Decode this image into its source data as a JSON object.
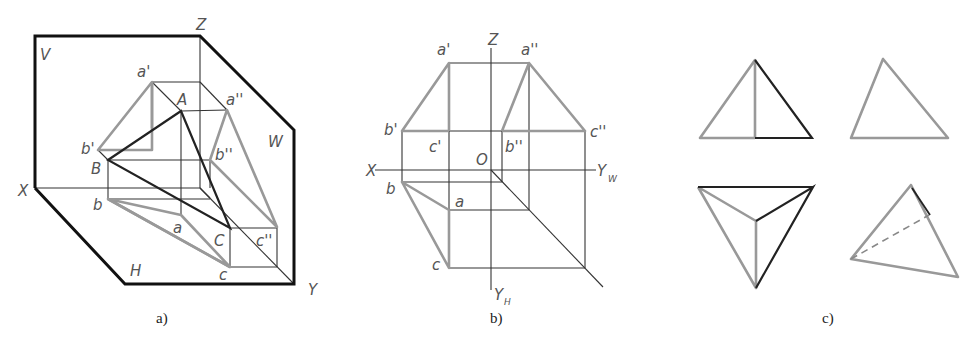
{
  "figure_a": {
    "caption": "a)",
    "labels": {
      "V": "V",
      "Z": "Z",
      "W": "W",
      "X": "X",
      "H": "H",
      "Y": "Y",
      "a_prime": "a'",
      "a_dprime": "a''",
      "A": "A",
      "b_prime": "b'",
      "B": "B",
      "b_dprime": "b''",
      "b": "b",
      "a": "a",
      "C": "C",
      "c_dprime": "c''",
      "c": "c"
    }
  },
  "figure_b": {
    "caption": "b)",
    "labels": {
      "Z": "Z",
      "X": "X",
      "O": "O",
      "Yw": "Y",
      "Yw_sub": "W",
      "Yh": "Y",
      "Yh_sub": "H",
      "a_prime": "a'",
      "b_prime": "b'",
      "c_prime": "c'",
      "a_dprime": "a''",
      "b_dprime": "b''",
      "c_dprime": "c''",
      "a": "a",
      "b": "b",
      "c": "c"
    }
  },
  "figure_c": {
    "caption": "c)"
  },
  "colors": {
    "plane_edge": "#111111",
    "projection_gray": "#999999",
    "construction_line": "#333333"
  }
}
